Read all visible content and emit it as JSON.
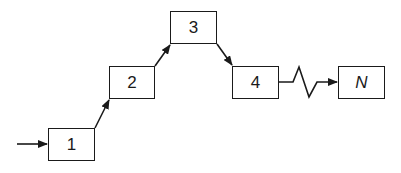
{
  "diagram": {
    "type": "staircase-flow",
    "nodes": [
      {
        "id": "1",
        "label": "1",
        "x": 48,
        "y": 128,
        "w": 47,
        "h": 33
      },
      {
        "id": "2",
        "label": "2",
        "x": 109,
        "y": 66,
        "w": 46,
        "h": 33
      },
      {
        "id": "3",
        "label": "3",
        "x": 170,
        "y": 11,
        "w": 47,
        "h": 33
      },
      {
        "id": "4",
        "label": "4",
        "x": 232,
        "y": 66,
        "w": 47,
        "h": 33
      },
      {
        "id": "N",
        "label": "N",
        "x": 338,
        "y": 66,
        "w": 47,
        "h": 33
      }
    ],
    "edges": [
      {
        "from": "input",
        "to": "1",
        "style": "arrow"
      },
      {
        "from": "1",
        "to": "2",
        "style": "arrow"
      },
      {
        "from": "2",
        "to": "3",
        "style": "arrow"
      },
      {
        "from": "3",
        "to": "4",
        "style": "arrow"
      },
      {
        "from": "4",
        "to": "N",
        "style": "zigzag-break-arrow"
      }
    ],
    "colors": {
      "stroke": "#1a1a1a",
      "background": "#ffffff"
    }
  }
}
